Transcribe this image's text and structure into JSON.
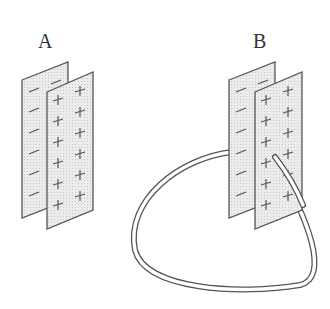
{
  "labels": {
    "a": "A",
    "b": "B"
  },
  "colors": {
    "plate_fill": "#e4e4e4",
    "plate_stroke": "#555555",
    "sign": "#555555",
    "wire": "#555555"
  },
  "plates": {
    "a": {
      "back_sign": "−",
      "front_sign": "+"
    },
    "b": {
      "back_sign": "−",
      "front_sign": "+",
      "connected_by_wire": true
    }
  }
}
